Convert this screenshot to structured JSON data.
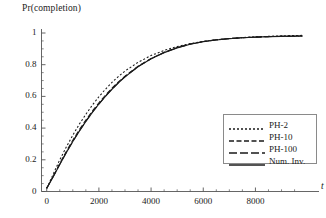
{
  "chart_data": {
    "type": "line",
    "title": "Pr(completion)",
    "xlabel": "t",
    "ylabel": "Pr(completion)",
    "xlim": [
      -200,
      9900
    ],
    "ylim": [
      0,
      1.02
    ],
    "grid": false,
    "legend_position": "lower-right",
    "xticks": [
      0,
      2000,
      4000,
      6000,
      8000
    ],
    "xtick_labels": [
      "0",
      "2000",
      "4000",
      "6000",
      "8000"
    ],
    "yticks": [
      0,
      0.2,
      0.4,
      0.6,
      0.8,
      1
    ],
    "ytick_labels": [
      "0",
      "0.2",
      "0.4",
      "0.6",
      "0.8",
      "1"
    ],
    "x": [
      0,
      250,
      500,
      750,
      1000,
      1250,
      1500,
      1750,
      2000,
      2250,
      2500,
      2750,
      3000,
      3500,
      4000,
      4500,
      5000,
      5500,
      6000,
      6500,
      7000,
      7500,
      8000,
      8500,
      9000,
      9500,
      9800
    ],
    "series": [
      {
        "name": "PH-2",
        "style": "dotted",
        "color": "#1a1a1a",
        "values": [
          0.02,
          0.11,
          0.2,
          0.28,
          0.355,
          0.425,
          0.487,
          0.545,
          0.598,
          0.645,
          0.688,
          0.726,
          0.76,
          0.815,
          0.858,
          0.89,
          0.915,
          0.933,
          0.947,
          0.957,
          0.965,
          0.971,
          0.976,
          0.979,
          0.982,
          0.984,
          0.985
        ]
      },
      {
        "name": "PH-10",
        "style": "dashed",
        "color": "#1a1a1a",
        "values": [
          0.02,
          0.097,
          0.177,
          0.253,
          0.324,
          0.39,
          0.451,
          0.508,
          0.56,
          0.608,
          0.652,
          0.692,
          0.728,
          0.79,
          0.839,
          0.878,
          0.908,
          0.93,
          0.946,
          0.957,
          0.965,
          0.97,
          0.974,
          0.977,
          0.979,
          0.98,
          0.981
        ]
      },
      {
        "name": "PH-100",
        "style": "long-dash",
        "color": "#1a1a1a",
        "values": [
          0.02,
          0.094,
          0.172,
          0.246,
          0.316,
          0.382,
          0.443,
          0.5,
          0.553,
          0.601,
          0.646,
          0.687,
          0.724,
          0.788,
          0.838,
          0.877,
          0.907,
          0.93,
          0.946,
          0.957,
          0.965,
          0.97,
          0.974,
          0.977,
          0.979,
          0.98,
          0.981
        ]
      },
      {
        "name": "Num. Inv.",
        "style": "solid",
        "color": "#1a1a1a",
        "values": [
          0.02,
          0.093,
          0.171,
          0.245,
          0.315,
          0.381,
          0.442,
          0.499,
          0.552,
          0.6,
          0.645,
          0.686,
          0.723,
          0.787,
          0.837,
          0.876,
          0.906,
          0.929,
          0.945,
          0.956,
          0.964,
          0.97,
          0.974,
          0.977,
          0.979,
          0.98,
          0.981
        ]
      }
    ]
  },
  "legend": {
    "entries": [
      {
        "label": "PH-2"
      },
      {
        "label": "PH-10"
      },
      {
        "label": "PH-100"
      },
      {
        "label": "Num. Inv."
      }
    ]
  }
}
